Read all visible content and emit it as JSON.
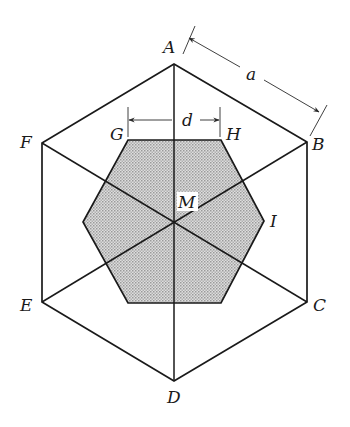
{
  "figure": {
    "outer_hexagon": {
      "vertices": {
        "A": [
          174,
          64
        ],
        "B": [
          307,
          142
        ],
        "C": [
          307,
          302
        ],
        "D": [
          174,
          381
        ],
        "E": [
          42,
          302
        ],
        "F": [
          42,
          143
        ]
      }
    },
    "inner_hexagon": {
      "fill_color": "#cbcbcb",
      "vertices": [
        [
          128,
          140
        ],
        [
          221,
          140
        ],
        [
          264,
          221
        ],
        [
          221,
          303
        ],
        [
          128,
          303
        ],
        [
          83,
          222
        ]
      ]
    },
    "center": [
      174,
      222
    ],
    "labels": {
      "A": "A",
      "B": "B",
      "C": "C",
      "D": "D",
      "E": "E",
      "F": "F",
      "G": "G",
      "H": "H",
      "I": "I",
      "M": "M",
      "a": "a",
      "d": "d"
    },
    "dimensions": {
      "a": {
        "meaning": "outer hexagon side length A–B"
      },
      "d": {
        "meaning": "inner hexagon top edge G–H"
      }
    },
    "line_color": "#1a1a1a"
  }
}
